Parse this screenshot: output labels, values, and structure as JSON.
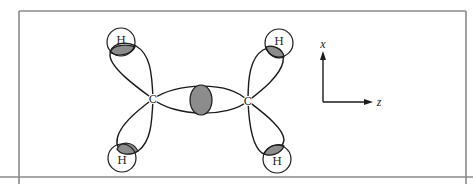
{
  "diagram": {
    "title": "",
    "atoms": {
      "carbon_left": {
        "label": "C"
      },
      "carbon_right": {
        "label": "C"
      },
      "h_top_left": {
        "label": "H"
      },
      "h_bottom_left": {
        "label": "H"
      },
      "h_top_right": {
        "label": "H"
      },
      "h_bottom_right": {
        "label": "H"
      }
    },
    "axes": {
      "vertical_label": "x",
      "horizontal_label": "z"
    },
    "colors": {
      "overlap_fill": "#8c8c8c",
      "line": "#1a1a1a",
      "frame": "#8a8a8a"
    }
  }
}
